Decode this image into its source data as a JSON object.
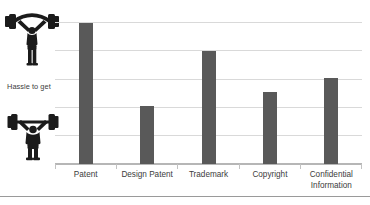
{
  "chart_data": {
    "type": "bar",
    "title": "",
    "xlabel": "",
    "ylabel": "Hassle to get",
    "categories": [
      "Patent",
      "Design Patent",
      "Trademark",
      "Copyright",
      "Confidential Information"
    ],
    "values": [
      5.0,
      2.05,
      4.0,
      2.55,
      3.05
    ],
    "ylim": [
      0,
      5
    ],
    "yticks": [
      0,
      1,
      2,
      3,
      4,
      5
    ],
    "ytick_labels": [
      "",
      "",
      "",
      "",
      "",
      ""
    ],
    "grid": true,
    "legend": false,
    "series": [
      {
        "name": "Hassle to get",
        "values": [
          5.0,
          2.05,
          4.0,
          2.55,
          3.05
        ],
        "color": "#595959"
      }
    ],
    "annotations": [
      {
        "name": "high-effort-lifter",
        "text": "weightlifter-arms-overhead",
        "position": "top-left-axis"
      },
      {
        "name": "low-effort-lifter",
        "text": "weightlifter-barbell-press",
        "position": "bottom-left-axis"
      }
    ]
  },
  "axis": {
    "y_caption": "Hassle to get",
    "icons": {
      "high": "weightlifter-high-icon",
      "low": "weightlifter-low-icon"
    }
  },
  "categories": [
    {
      "line1": "Patent",
      "line2": ""
    },
    {
      "line1": "Design Patent",
      "line2": ""
    },
    {
      "line1": "Trademark",
      "line2": ""
    },
    {
      "line1": "Copyright",
      "line2": ""
    },
    {
      "line1": "Confidential",
      "line2": "Information"
    }
  ],
  "colors": {
    "bar": "#595959",
    "gridline": "#d9d9d9",
    "axis": "#b6b6b6",
    "text": "#3c3c3c",
    "icon": "#1b1b1b",
    "background": "#ffffff"
  }
}
